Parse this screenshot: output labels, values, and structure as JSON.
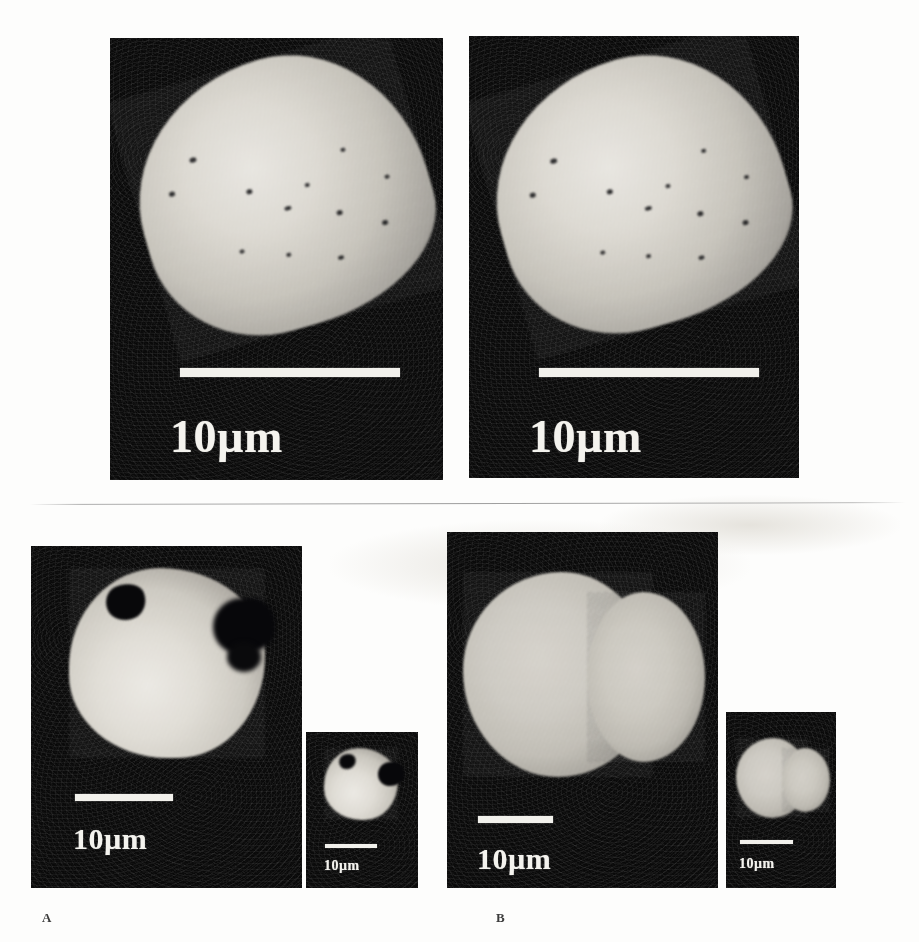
{
  "figure": {
    "type": "scanning-electron-micrograph-plate",
    "background_color": "#fdfdfc",
    "panel_background_color": "#000000",
    "scalebar_color": "#f2f1ec",
    "label_color": "#3c3c3c",
    "part_labels": [
      {
        "name": "part-label-a",
        "text": "A"
      },
      {
        "name": "part-label-b",
        "text": "B"
      }
    ]
  },
  "panels": [
    {
      "id": "top-left",
      "name": "micrograph-top-left",
      "caption": "",
      "scalebar": {
        "label": "10µm",
        "length_um": 10
      },
      "subject": "elongated irregular particle with dark surface speckles, tilted upper-left to lower-right"
    },
    {
      "id": "top-right",
      "name": "micrograph-top-right",
      "caption": "",
      "scalebar": {
        "label": "10µm",
        "length_um": 10
      },
      "subject": "elongated irregular particle with dark surface speckles, tilted upper-left to lower-right"
    },
    {
      "id": "bottom-a-main",
      "name": "micrograph-panel-a-main",
      "caption": "A",
      "scalebar": {
        "label": "10µm",
        "length_um": 10
      },
      "subject": "rounded particle with dark notch at upper-left and cleft at right edge"
    },
    {
      "id": "bottom-a-inset",
      "name": "micrograph-panel-a-inset",
      "caption": "",
      "scalebar": {
        "label": "10µm",
        "length_um": 10
      },
      "subject": "lower magnification view of the same rounded particle with dark notch"
    },
    {
      "id": "bottom-b-main",
      "name": "micrograph-panel-b-main",
      "caption": "B",
      "scalebar": {
        "label": "10µm",
        "length_um": 10
      },
      "subject": "large smooth two-lobed spheroidal particle"
    },
    {
      "id": "bottom-b-inset",
      "name": "micrograph-panel-b-inset",
      "caption": "",
      "scalebar": {
        "label": "10µm",
        "length_um": 10
      },
      "subject": "lower magnification view of the same two-lobed spheroidal particle"
    }
  ]
}
